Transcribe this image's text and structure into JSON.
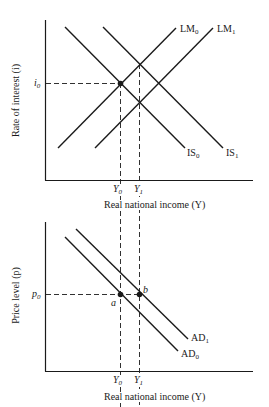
{
  "top_panel": {
    "y_axis_label": "Rate of interest (i)",
    "x_axis_label": "Real national income (Y)",
    "y_tick": {
      "sym": "i",
      "sub": "0"
    },
    "x_ticks": [
      {
        "sym": "Y",
        "sub": "0"
      },
      {
        "sym": "Y",
        "sub": "1"
      }
    ],
    "curves": [
      {
        "name": "IS",
        "sub": "0"
      },
      {
        "name": "IS",
        "sub": "1"
      },
      {
        "name": "LM",
        "sub": "0"
      },
      {
        "name": "LM",
        "sub": "1"
      }
    ]
  },
  "bottom_panel": {
    "y_axis_label": "Price level (p)",
    "x_axis_label": "Real national income (Y)",
    "y_tick": {
      "sym": "p",
      "sub": "0"
    },
    "x_ticks": [
      {
        "sym": "Y",
        "sub": "0"
      },
      {
        "sym": "Y",
        "sub": "1"
      }
    ],
    "curves": [
      {
        "name": "AD",
        "sub": "0"
      },
      {
        "name": "AD",
        "sub": "1"
      }
    ],
    "points": [
      {
        "label": "a"
      },
      {
        "label": "b"
      }
    ]
  }
}
